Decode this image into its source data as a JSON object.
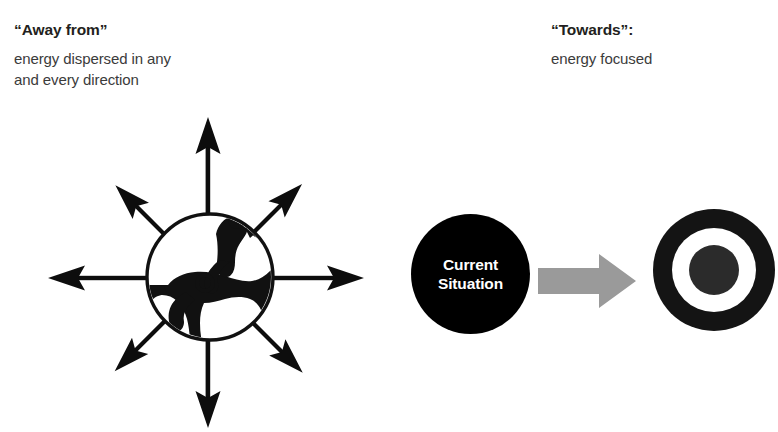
{
  "canvas": {
    "width": 778,
    "height": 432,
    "background": "#ffffff"
  },
  "colors": {
    "ink": "#000000",
    "heading_text": "#231f20",
    "body_text": "#3b3b3b",
    "arrow_gray": "#9a9a9a",
    "node_fill": "#000000",
    "node_text": "#ffffff"
  },
  "away_panel": {
    "heading": "“Away from”",
    "subline_1": "energy dispersed in any",
    "subline_2": "and every direction",
    "graphic": {
      "name": "bucking-bronco-starburst",
      "arrow_count": 8,
      "arrow_directions": [
        "up",
        "up-right",
        "right",
        "down-right",
        "down",
        "down-left",
        "left",
        "up-left"
      ]
    }
  },
  "towards_panel": {
    "heading": "“Towards”:",
    "subline_1": "energy focused",
    "current_situation": {
      "line_1": "Current",
      "line_2": "Situation"
    },
    "flow_arrow": {
      "direction": "right",
      "color": "#9a9a9a"
    },
    "target": {
      "name": "bullseye-target",
      "rings": [
        "black",
        "white",
        "black"
      ]
    }
  }
}
